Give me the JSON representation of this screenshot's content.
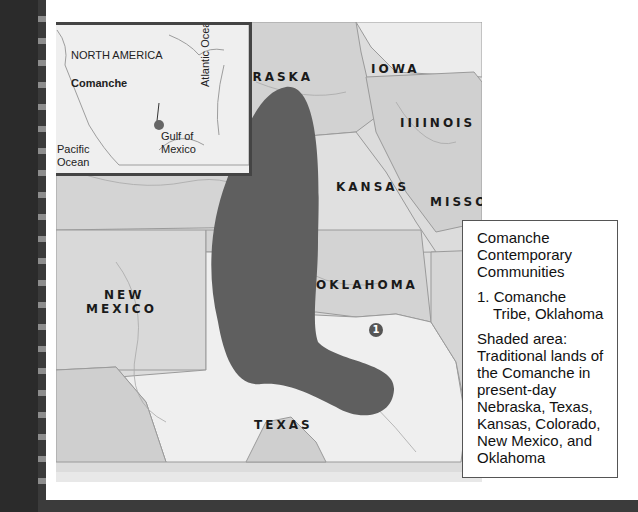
{
  "map": {
    "states": [
      {
        "name": "NEBRASKA"
      },
      {
        "name": "IOWA"
      },
      {
        "name": "IIIINOIS"
      },
      {
        "name": "KANSAS"
      },
      {
        "name": "MISSOURI"
      },
      {
        "name": "NEW"
      },
      {
        "name": "MEXICO"
      },
      {
        "name": "OKLAHOMA"
      },
      {
        "name": "TEXAS"
      }
    ],
    "marker": {
      "number": "1"
    },
    "colors": {
      "territory": "#5f5f5f",
      "state_dark": "#cdcdcd",
      "state_light": "#eeeeee",
      "water_lines": "#a8a8a8"
    }
  },
  "inset": {
    "title": "NORTH AMERICA",
    "location_label": "Comanche",
    "pacific_line1": "Pacific",
    "pacific_line2": "Ocean",
    "gulf_line1": "Gulf of",
    "gulf_line2": "Mexico",
    "atlantic": "Atlantic Ocean"
  },
  "legend": {
    "title_lines": [
      "Comanche",
      "Contemporary",
      "Communities"
    ],
    "item_1": "1. Comanche Tribe, Oklahoma",
    "description": "Shaded area: Traditional lands of the Comanche in present-day Nebraska, Texas, Kansas, Colorado, New Mexico, and Oklahoma"
  }
}
